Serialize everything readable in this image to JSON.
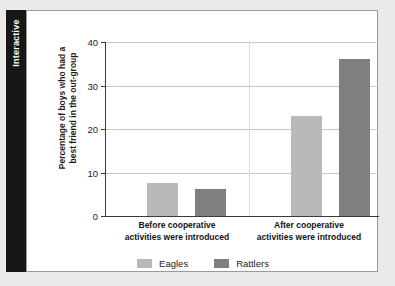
{
  "side_tab": {
    "label": "Interactive"
  },
  "chart_data": {
    "type": "bar",
    "title": "",
    "xlabel": "",
    "ylabel": "Percentage of boys who had a best friend in the out-group",
    "ylabel_lines": [
      "Percentage of boys who had a",
      "best friend in the out-group"
    ],
    "ylim": [
      0,
      40
    ],
    "yticks": [
      0,
      10,
      20,
      30,
      40
    ],
    "ytick_labels": [
      "0",
      "10",
      "20",
      "30",
      "40"
    ],
    "grid": true,
    "legend_position": "bottom",
    "categories": [
      "Before cooperative activities were introduced",
      "After cooperative activities were introduced"
    ],
    "category_lines": [
      [
        "Before cooperative",
        "activities were introduced"
      ],
      [
        "After cooperative",
        "activities were introduced"
      ]
    ],
    "series": [
      {
        "name": "Eagles",
        "color": "#b9b9b9",
        "values": [
          7.5,
          23
        ]
      },
      {
        "name": "Rattlers",
        "color": "#7f7f7f",
        "values": [
          6.3,
          36
        ]
      }
    ],
    "colors": {
      "eagles": "#b9b9b9",
      "rattlers": "#7f7f7f",
      "gridline": "#c9c9c9",
      "axis": "#3a3a3a",
      "divider": "#c4c4c4",
      "card_background": "#ffffff",
      "page_background": "#eceae8",
      "tab_background": "#171717"
    }
  }
}
